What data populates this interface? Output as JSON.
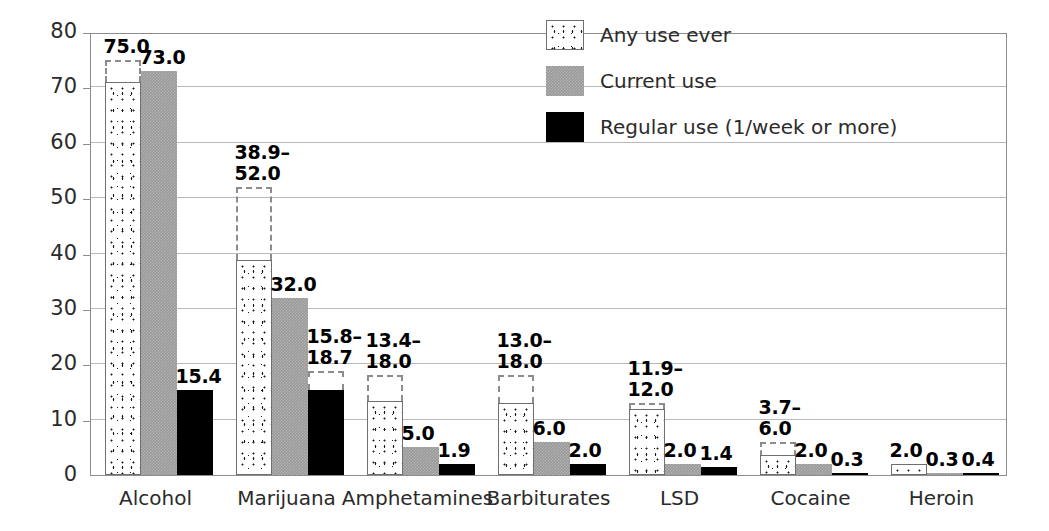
{
  "chart_data": {
    "type": "bar",
    "title": "",
    "subtitle": "",
    "xlabel": "",
    "ylabel": "Percent",
    "ylim": [
      0,
      80
    ],
    "yticks": [
      0,
      10,
      20,
      30,
      40,
      50,
      60,
      70,
      80
    ],
    "ytick_labels": [
      "0",
      "10",
      "20",
      "30",
      "40",
      "50",
      "60",
      "70",
      "80"
    ],
    "grid": true,
    "legend_position": "top-right",
    "categories": [
      "Alcohol",
      "Marijuana",
      "Amphetamines",
      "Barbiturates",
      "LSD",
      "Cocaine",
      "Heroin"
    ],
    "series": [
      {
        "name": "Any use ever",
        "style": "stippled",
        "color": "#ffffff",
        "values": [
          71.0,
          38.9,
          13.4,
          13.0,
          11.9,
          3.7,
          2.0
        ],
        "range_high": [
          75.0,
          52.0,
          18.0,
          18.0,
          12.0,
          6.0,
          null
        ],
        "labels": [
          "75.0",
          "38.9–\n52.0",
          "13.4–\n18.0",
          "13.0–\n18.0",
          "11.9–\n12.0",
          "3.7–\n6.0",
          "2.0"
        ]
      },
      {
        "name": "Current use",
        "style": "gray",
        "color": "#999999",
        "values": [
          73.0,
          32.0,
          5.0,
          6.0,
          2.0,
          2.0,
          0.3
        ],
        "range_high": [
          null,
          null,
          null,
          null,
          null,
          null,
          null
        ],
        "labels": [
          "73.0",
          "32.0",
          "5.0",
          "6.0",
          "2.0",
          "2.0",
          "0.3"
        ]
      },
      {
        "name": "Regular use (1/week or more)",
        "style": "black",
        "color": "#000000",
        "values": [
          15.4,
          15.4,
          1.9,
          2.0,
          1.4,
          0.3,
          0.4
        ],
        "range_high": [
          null,
          18.7,
          null,
          null,
          null,
          null,
          null
        ],
        "labels": [
          "15.4",
          "15.8–\n18.7",
          "1.9",
          "2.0",
          "1.4",
          "0.3",
          "0.4"
        ]
      }
    ]
  },
  "legend": {
    "items": [
      {
        "label": "Any use ever",
        "swatch": "stippled"
      },
      {
        "label": "Current use",
        "swatch": "gray"
      },
      {
        "label": "Regular use (1/week or more)",
        "swatch": "black"
      }
    ]
  },
  "axis": {
    "y_title": "Percent"
  }
}
